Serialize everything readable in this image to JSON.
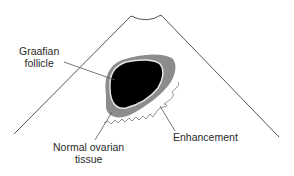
{
  "diagram": {
    "type": "ultrasound-schematic",
    "labels": {
      "follicle_line1": "Graafian",
      "follicle_line2": "follicle",
      "normal_line1": "Normal ovarian",
      "normal_line2": "tissue",
      "enhancement": "Enhancement"
    },
    "colors": {
      "follicle": "#000000",
      "ovarian_tissue": "#8c8c8c",
      "rim": "#e6e6e6",
      "lines": "#555555",
      "text": "#2a2a2a"
    }
  }
}
